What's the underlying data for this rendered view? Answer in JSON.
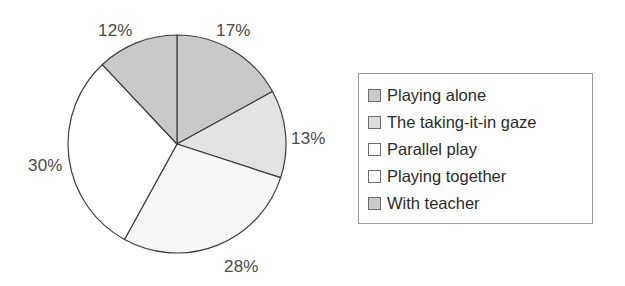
{
  "chart_data": {
    "type": "pie",
    "title": "",
    "subtitle": "",
    "xlabel": "",
    "ylabel": "",
    "grid": false,
    "legend_position": "right",
    "start_angle_deg": 0,
    "direction": "clockwise",
    "categories": [
      "Playing alone",
      "The taking-it-in gaze",
      "Parallel play",
      "Playing together",
      "With teacher"
    ],
    "values": [
      17,
      13,
      28,
      30,
      12
    ],
    "value_labels": [
      "17%",
      "13%",
      "28%",
      "30%",
      "12%"
    ],
    "colors": [
      "#c9c9c9",
      "#e3e3e3",
      "#f6f6f6",
      "#ffffff",
      "#c9c9c9"
    ],
    "slice_outline_color": "#3d3d3d",
    "slices": [
      {
        "label": "Playing alone",
        "value": 17,
        "value_label": "17%",
        "color": "#c9c9c9"
      },
      {
        "label": "The taking-it-in gaze",
        "value": 13,
        "value_label": "13%",
        "color": "#e3e3e3"
      },
      {
        "label": "Parallel play",
        "value": 28,
        "value_label": "28%",
        "color": "#f6f6f6"
      },
      {
        "label": "Playing together",
        "value": 30,
        "value_label": "30%",
        "color": "#ffffff"
      },
      {
        "label": "With teacher",
        "value": 12,
        "value_label": "12%",
        "color": "#c9c9c9"
      }
    ]
  },
  "pie": {
    "labels": {
      "p17": "17%",
      "p13": "13%",
      "p28": "28%",
      "p30": "30%",
      "p12": "12%"
    }
  },
  "legend": {
    "items": [
      {
        "label": "Playing alone",
        "color": "#c9c9c9"
      },
      {
        "label": "The taking-it-in gaze",
        "color": "#dcdcdc"
      },
      {
        "label": "Parallel play",
        "color": "#fbfbfb"
      },
      {
        "label": "Playing together",
        "color": "#ffffff"
      },
      {
        "label": "With teacher",
        "color": "#c9c9c9"
      }
    ]
  }
}
